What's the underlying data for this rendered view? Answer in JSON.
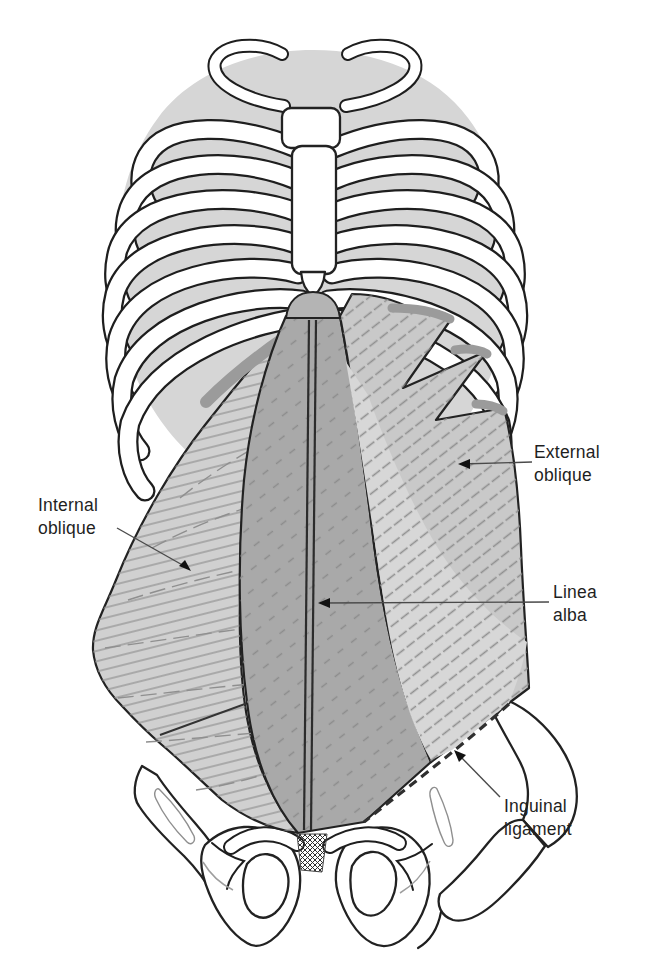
{
  "diagram": {
    "type": "anatomical-illustration",
    "labels": {
      "internal_oblique": {
        "line1": "Internal",
        "line2": "oblique"
      },
      "external_oblique": {
        "line1": "External",
        "line2": "oblique"
      },
      "linea_alba": {
        "line1": "Linea",
        "line2": "alba"
      },
      "inguinal_ligament": {
        "line1": "Inguinal",
        "line2": "ligament"
      }
    },
    "colors": {
      "background": "#ffffff",
      "thorax_fill": "#d6d6d6",
      "bone_fill": "#ffffff",
      "outline": "#222222",
      "rectus_sheath": "#a9a9a9",
      "external_oblique": "#c9c9c9",
      "external_oblique_light": "#d7d7d7",
      "internal_oblique": "#d0d0d0",
      "costal_arch": "#b4b4b4",
      "cut_edge": "#9b9b9b",
      "hatch_line": "#8f8f8f",
      "label_text": "#1f1f1f",
      "leader_line": "#4a4a4a"
    }
  }
}
